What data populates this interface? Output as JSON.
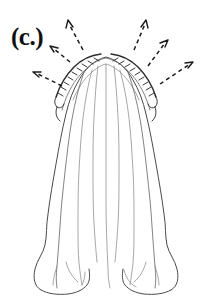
{
  "figure": {
    "panel_label": "(c.)",
    "background_color": "#ffffff",
    "width": 217,
    "height": 308,
    "ink_colors": {
      "outline": "#4a4a4a",
      "inner_line": "#6b6b6b",
      "faint_line": "#8a8a8a",
      "crest_ridge": "#2c2c2c",
      "annotation": "#1a1a1a"
    },
    "annotations": {
      "style": "dashed leader lines with open arrowheads",
      "count": 6,
      "direction": "radiating outward from the arch crest",
      "arrows": [
        {
          "name": "arrow-left-lower",
          "tail_x": 62,
          "tail_y": 86,
          "tip_x": 33,
          "tip_y": 72
        },
        {
          "name": "arrow-left-upper",
          "tail_x": 70,
          "tail_y": 62,
          "tip_x": 50,
          "tip_y": 46
        },
        {
          "name": "arrow-crest-left",
          "tail_x": 83,
          "tail_y": 50,
          "tip_x": 68,
          "tip_y": 20
        },
        {
          "name": "arrow-crest-right",
          "tail_x": 134,
          "tail_y": 50,
          "tip_x": 146,
          "tip_y": 20
        },
        {
          "name": "arrow-right-upper",
          "tail_x": 148,
          "tail_y": 66,
          "tip_x": 168,
          "tip_y": 40
        },
        {
          "name": "arrow-right-lower",
          "tail_x": 160,
          "tail_y": 84,
          "tip_x": 193,
          "tip_y": 62
        }
      ]
    }
  }
}
